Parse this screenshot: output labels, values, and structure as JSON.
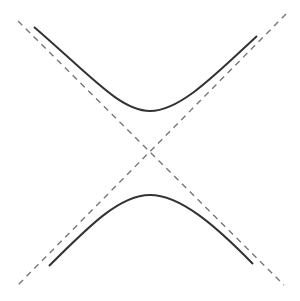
{
  "diagram": {
    "type": "hyperbola-with-asymptotes",
    "width": 300,
    "height": 301,
    "background": "#ffffff",
    "center": [
      150,
      152
    ],
    "colors": {
      "curve": "#333333",
      "asymptote": "#777777"
    },
    "asymptotes": [
      {
        "name": "asymptote-descending",
        "x1": 18,
        "y1": 21,
        "x2": 284,
        "y2": 285
      },
      {
        "name": "asymptote-ascending",
        "x1": 286,
        "y1": 14,
        "x2": 17,
        "y2": 286
      }
    ],
    "branches": [
      {
        "name": "upper-branch",
        "path": "M34,27 C90,75 120,111 150,111 C180,111 215,75 257,36"
      },
      {
        "name": "lower-branch",
        "path": "M49,266 C90,225 120,195 150,195 C180,195 215,225 253,264"
      }
    ]
  }
}
